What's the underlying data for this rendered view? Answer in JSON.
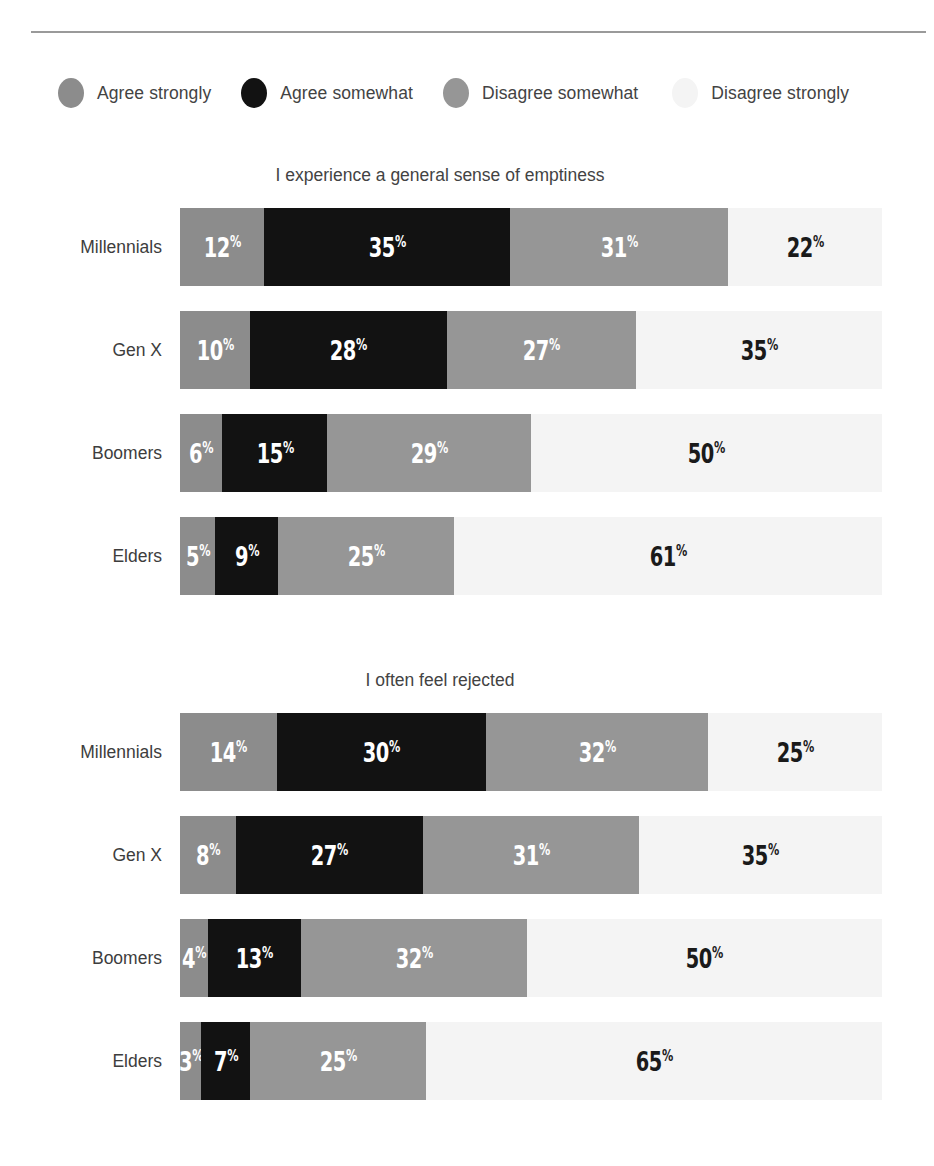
{
  "legend": {
    "items": [
      {
        "label": "Agree strongly",
        "color": "#8c8c8c",
        "key": "agree_strongly"
      },
      {
        "label": "Agree somewhat",
        "color": "#121212",
        "key": "agree_somewhat"
      },
      {
        "label": "Disagree somewhat",
        "color": "#969696",
        "key": "disagree_somewhat"
      },
      {
        "label": "Disagree strongly",
        "color": "#f4f4f4",
        "key": "disagree_strongly"
      }
    ]
  },
  "charts": [
    {
      "title": "I experience a general sense of emptiness",
      "categories": [
        "Millennials",
        "Gen X",
        "Boomers",
        "Elders"
      ],
      "rows": [
        {
          "category": "Millennials",
          "values": [
            12,
            35,
            31,
            22
          ],
          "labels": [
            "12",
            "35",
            "31",
            "22"
          ]
        },
        {
          "category": "Gen X",
          "values": [
            10,
            28,
            27,
            35
          ],
          "labels": [
            "10",
            "28",
            "27",
            "35"
          ]
        },
        {
          "category": "Boomers",
          "values": [
            6,
            15,
            29,
            50
          ],
          "labels": [
            "6",
            "15",
            "29",
            "50"
          ]
        },
        {
          "category": "Elders",
          "values": [
            5,
            9,
            25,
            61
          ],
          "labels": [
            "5",
            "9",
            "25",
            "61"
          ]
        }
      ]
    },
    {
      "title": "I often feel rejected",
      "categories": [
        "Millennials",
        "Gen X",
        "Boomers",
        "Elders"
      ],
      "rows": [
        {
          "category": "Millennials",
          "values": [
            14,
            30,
            32,
            25
          ],
          "labels": [
            "14",
            "30",
            "32",
            "25"
          ]
        },
        {
          "category": "Gen X",
          "values": [
            8,
            27,
            31,
            35
          ],
          "labels": [
            "8",
            "27",
            "31",
            "35"
          ]
        },
        {
          "category": "Boomers",
          "values": [
            4,
            13,
            32,
            50
          ],
          "labels": [
            "4",
            "13",
            "32",
            "50"
          ]
        },
        {
          "category": "Elders",
          "values": [
            3,
            7,
            25,
            65
          ],
          "labels": [
            "3",
            "7",
            "25",
            "65"
          ]
        }
      ]
    }
  ],
  "percent_symbol": "%",
  "chart_data": [
    {
      "type": "bar",
      "orientation": "horizontal",
      "stacked": true,
      "normalized_percent": true,
      "title": "I experience a general sense of emptiness",
      "xlabel": "",
      "ylabel": "",
      "xlim": [
        0,
        100
      ],
      "grid": false,
      "legend_position": "top",
      "categories": [
        "Millennials",
        "Gen X",
        "Boomers",
        "Elders"
      ],
      "series": [
        {
          "name": "Agree strongly",
          "color": "#8c8c8c",
          "values": [
            12,
            10,
            6,
            5
          ]
        },
        {
          "name": "Agree somewhat",
          "color": "#121212",
          "values": [
            35,
            28,
            15,
            9
          ]
        },
        {
          "name": "Disagree somewhat",
          "color": "#969696",
          "values": [
            31,
            27,
            29,
            25
          ]
        },
        {
          "name": "Disagree strongly",
          "color": "#f4f4f4",
          "values": [
            22,
            35,
            50,
            61
          ]
        }
      ]
    },
    {
      "type": "bar",
      "orientation": "horizontal",
      "stacked": true,
      "normalized_percent": true,
      "title": "I often feel rejected",
      "xlabel": "",
      "ylabel": "",
      "xlim": [
        0,
        100
      ],
      "grid": false,
      "legend_position": "top",
      "categories": [
        "Millennials",
        "Gen X",
        "Boomers",
        "Elders"
      ],
      "series": [
        {
          "name": "Agree strongly",
          "color": "#8c8c8c",
          "values": [
            14,
            8,
            4,
            3
          ]
        },
        {
          "name": "Agree somewhat",
          "color": "#121212",
          "values": [
            30,
            27,
            13,
            7
          ]
        },
        {
          "name": "Disagree somewhat",
          "color": "#969696",
          "values": [
            32,
            31,
            32,
            25
          ]
        },
        {
          "name": "Disagree strongly",
          "color": "#f4f4f4",
          "values": [
            25,
            35,
            50,
            65
          ]
        }
      ]
    }
  ]
}
